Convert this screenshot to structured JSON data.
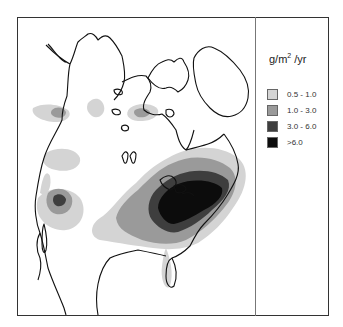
{
  "figure": {
    "caption_fragment": "",
    "map": {
      "region": "North America",
      "description": "Deposition contour map over North America with coastlines"
    },
    "legend": {
      "unit_main": "g/m",
      "unit_sup": "2",
      "unit_tail": " /yr",
      "items": [
        {
          "label": "0.5 - 1.0",
          "color": "#d4d4d4"
        },
        {
          "label": "1.0 - 3.0",
          "color": "#9a9a9a"
        },
        {
          "label": "3.0 - 6.0",
          "color": "#3e3e3e"
        },
        {
          "label": ">6.0",
          "color": "#0c0c0c"
        }
      ]
    }
  }
}
